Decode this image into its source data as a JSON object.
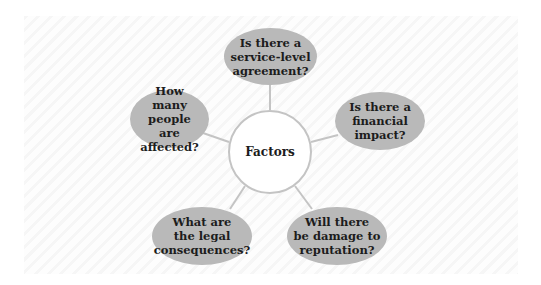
{
  "diagram": {
    "type": "mind-map",
    "center": {
      "label": "Factors"
    },
    "nodes": [
      {
        "id": "top",
        "label": "Is there a\nservice-level\nagreement?"
      },
      {
        "id": "right",
        "label": "Is there a\nfinancial\nimpact?"
      },
      {
        "id": "bottom-right",
        "label": "Will there\nbe damage to\nreputation?"
      },
      {
        "id": "bottom-left",
        "label": "What are\nthe legal\nconsequences?"
      },
      {
        "id": "left",
        "label": "How many\npeople are\naffected?"
      }
    ],
    "colors": {
      "bubble_fill": "#b9b9b9",
      "center_border": "#c4c4c4",
      "connector": "#c4c4c4",
      "text": "#1c1c1c",
      "background_stripe": "#f6f6f6"
    }
  }
}
